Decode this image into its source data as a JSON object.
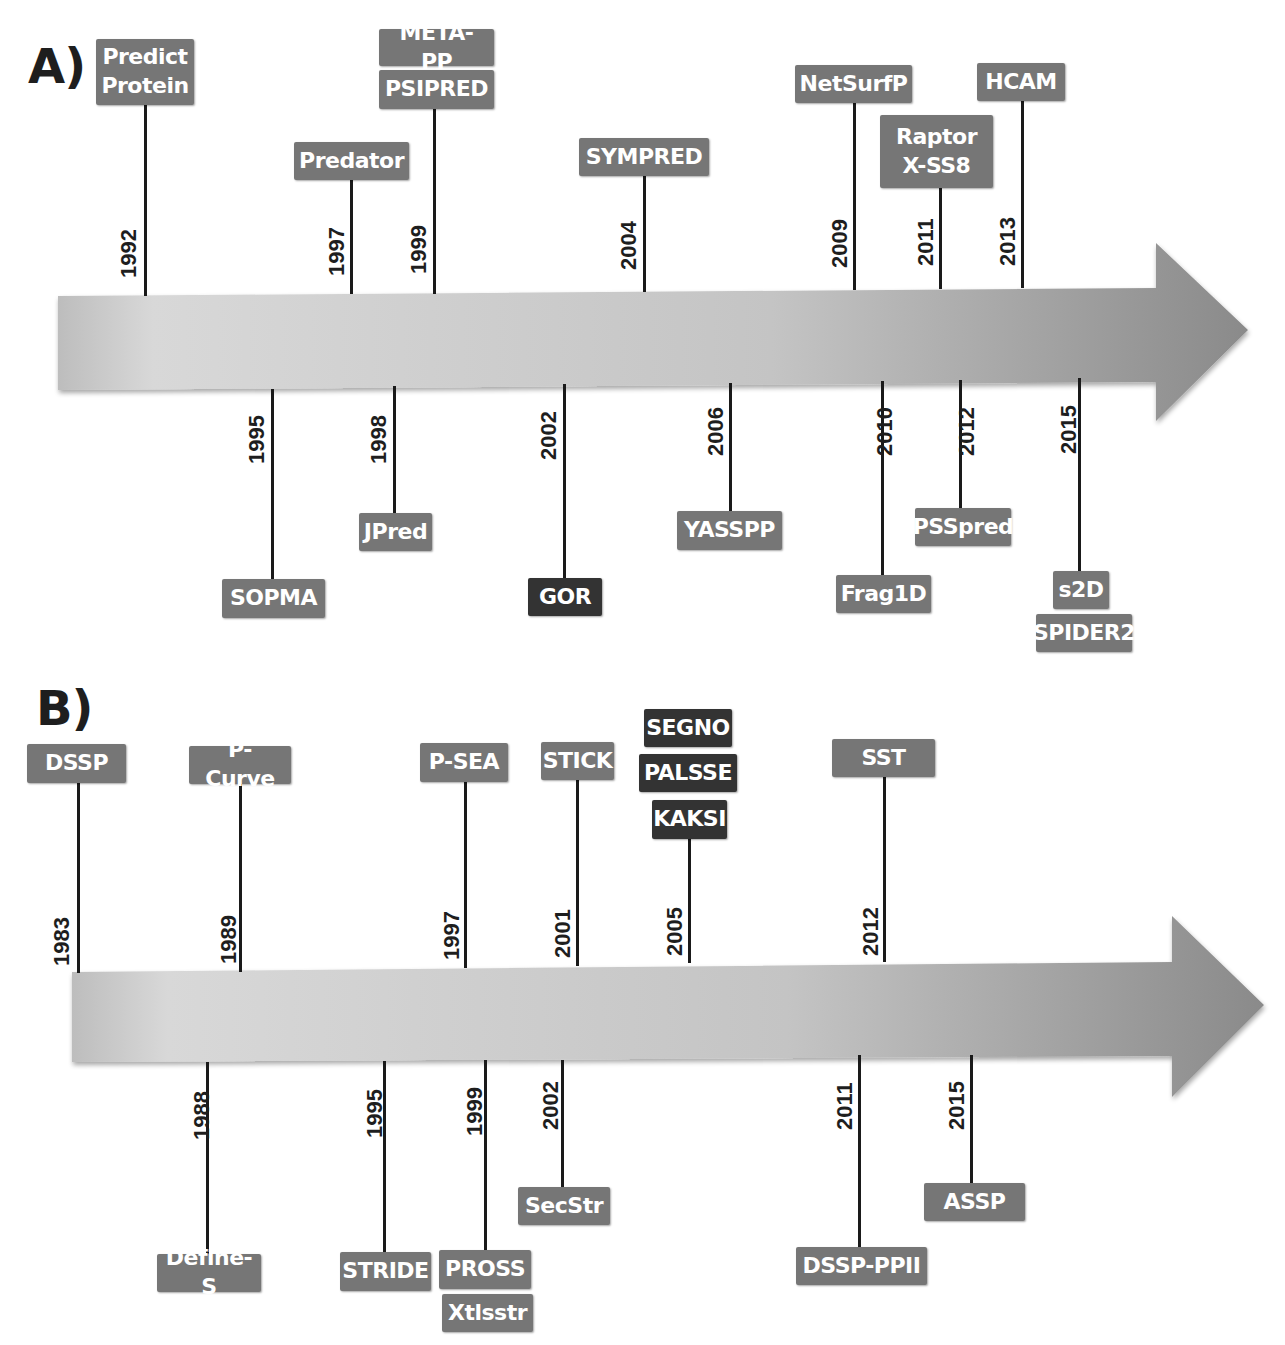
{
  "panels": {
    "a": {
      "label": "A)",
      "above": [
        {
          "year": "1992",
          "tools": [
            "Predict Protein"
          ]
        },
        {
          "year": "1997",
          "tools": [
            "Predator"
          ]
        },
        {
          "year": "1999",
          "tools": [
            "META-PP",
            "PSIPRED"
          ]
        },
        {
          "year": "2004",
          "tools": [
            "SYMPRED"
          ]
        },
        {
          "year": "2009",
          "tools": [
            "NetSurfP"
          ]
        },
        {
          "year": "2011",
          "tools": [
            "Raptor X-SS8"
          ]
        },
        {
          "year": "2013",
          "tools": [
            "HCAM"
          ]
        }
      ],
      "below": [
        {
          "year": "1995",
          "tools": [
            "SOPMA"
          ]
        },
        {
          "year": "1998",
          "tools": [
            "JPred"
          ]
        },
        {
          "year": "2002",
          "tools": [
            "GOR"
          ]
        },
        {
          "year": "2006",
          "tools": [
            "YASSPP"
          ]
        },
        {
          "year": "2010",
          "tools": [
            "Frag1D"
          ]
        },
        {
          "year": "2012",
          "tools": [
            "PSSpred"
          ]
        },
        {
          "year": "2015",
          "tools": [
            "s2D",
            "SPIDER2"
          ]
        }
      ],
      "labels": {
        "predict_l1": "Predict",
        "predict_l2": "Protein",
        "raptor_l1": "Raptor",
        "raptor_l2": "X-SS8"
      }
    },
    "b": {
      "label": "B)",
      "above": [
        {
          "year": "1983",
          "tools": [
            "DSSP"
          ]
        },
        {
          "year": "1989",
          "tools": [
            "P-Curve"
          ]
        },
        {
          "year": "1997",
          "tools": [
            "P-SEA"
          ]
        },
        {
          "year": "2001",
          "tools": [
            "STICK"
          ]
        },
        {
          "year": "2005",
          "tools": [
            "SEGNO",
            "PALSSE",
            "KAKSI"
          ]
        },
        {
          "year": "2012",
          "tools": [
            "SST"
          ]
        }
      ],
      "below": [
        {
          "year": "1988",
          "tools": [
            "Define-S"
          ]
        },
        {
          "year": "1995",
          "tools": [
            "STRIDE"
          ]
        },
        {
          "year": "1999",
          "tools": [
            "PROSS",
            "Xtlsstr"
          ]
        },
        {
          "year": "2002",
          "tools": [
            "SecStr"
          ]
        },
        {
          "year": "2011",
          "tools": [
            "DSSP-PPII"
          ]
        },
        {
          "year": "2015",
          "tools": [
            "ASSP"
          ]
        }
      ]
    }
  },
  "colors": {
    "tag_default": "#767676",
    "tag_highlight": "#333333",
    "stem": "#1a1a1a",
    "arrow_light": "#d6d6d6",
    "arrow_dark": "#8c8c8c"
  }
}
